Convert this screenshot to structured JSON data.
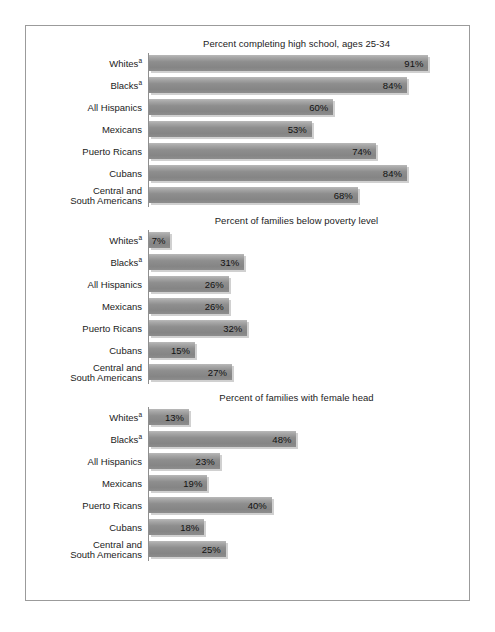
{
  "chart_data": [
    {
      "type": "bar",
      "orientation": "horizontal",
      "title": "Percent completing high school, ages 25-34",
      "xlabel": "",
      "ylabel": "",
      "xlim": [
        0,
        100
      ],
      "grid": false,
      "legend": "none",
      "categories": [
        "Whitesᵃ",
        "Blacksᵃ",
        "All Hispanics",
        "Mexicans",
        "Puerto Ricans",
        "Cubans",
        "Central and\nSouth Americans"
      ],
      "values": [
        91,
        84,
        60,
        53,
        74,
        84,
        68
      ],
      "value_labels": [
        "91%",
        "84%",
        "60%",
        "53%",
        "74%",
        "84%",
        "68%"
      ]
    },
    {
      "type": "bar",
      "orientation": "horizontal",
      "title": "Percent of families below poverty level",
      "xlabel": "",
      "ylabel": "",
      "xlim": [
        0,
        100
      ],
      "grid": false,
      "legend": "none",
      "categories": [
        "Whitesᵃ",
        "Blacksᵃ",
        "All Hispanics",
        "Mexicans",
        "Puerto Ricans",
        "Cubans",
        "Central and\nSouth Americans"
      ],
      "values": [
        7,
        31,
        26,
        26,
        32,
        15,
        27
      ],
      "value_labels": [
        "7%",
        "31%",
        "26%",
        "26%",
        "32%",
        "15%",
        "27%"
      ]
    },
    {
      "type": "bar",
      "orientation": "horizontal",
      "title": "Percent of families with female head",
      "xlabel": "",
      "ylabel": "",
      "xlim": [
        0,
        100
      ],
      "grid": false,
      "legend": "none",
      "categories": [
        "Whitesᵃ",
        "Blacksᵃ",
        "All Hispanics",
        "Mexicans",
        "Puerto Ricans",
        "Cubans",
        "Central and\nSouth Americans"
      ],
      "values": [
        13,
        48,
        23,
        19,
        40,
        18,
        25
      ],
      "value_labels": [
        "13%",
        "48%",
        "23%",
        "19%",
        "40%",
        "18%",
        "25%"
      ]
    }
  ],
  "panels": [
    {
      "title": "Percent completing high school, ages 25-34",
      "rows": [
        {
          "label": "Whites",
          "sup": "a",
          "value": 91,
          "value_label": "91%"
        },
        {
          "label": "Blacks",
          "sup": "a",
          "value": 84,
          "value_label": "84%"
        },
        {
          "label": "All Hispanics",
          "sup": "",
          "value": 60,
          "value_label": "60%"
        },
        {
          "label": "Mexicans",
          "sup": "",
          "value": 53,
          "value_label": "53%"
        },
        {
          "label": "Puerto Ricans",
          "sup": "",
          "value": 74,
          "value_label": "74%"
        },
        {
          "label": "Cubans",
          "sup": "",
          "value": 84,
          "value_label": "84%"
        },
        {
          "label": "Central and\nSouth Americans",
          "sup": "",
          "value": 68,
          "value_label": "68%"
        }
      ]
    },
    {
      "title": "Percent of families below poverty level",
      "rows": [
        {
          "label": "Whites",
          "sup": "a",
          "value": 7,
          "value_label": "7%"
        },
        {
          "label": "Blacks",
          "sup": "a",
          "value": 31,
          "value_label": "31%"
        },
        {
          "label": "All Hispanics",
          "sup": "",
          "value": 26,
          "value_label": "26%"
        },
        {
          "label": "Mexicans",
          "sup": "",
          "value": 26,
          "value_label": "26%"
        },
        {
          "label": "Puerto Ricans",
          "sup": "",
          "value": 32,
          "value_label": "32%"
        },
        {
          "label": "Cubans",
          "sup": "",
          "value": 15,
          "value_label": "15%"
        },
        {
          "label": "Central and\nSouth Americans",
          "sup": "",
          "value": 27,
          "value_label": "27%"
        }
      ]
    },
    {
      "title": "Percent of families with female head",
      "rows": [
        {
          "label": "Whites",
          "sup": "a",
          "value": 13,
          "value_label": "13%"
        },
        {
          "label": "Blacks",
          "sup": "a",
          "value": 48,
          "value_label": "48%"
        },
        {
          "label": "All Hispanics",
          "sup": "",
          "value": 23,
          "value_label": "23%"
        },
        {
          "label": "Mexicans",
          "sup": "",
          "value": 19,
          "value_label": "19%"
        },
        {
          "label": "Puerto Ricans",
          "sup": "",
          "value": 40,
          "value_label": "40%"
        },
        {
          "label": "Cubans",
          "sup": "",
          "value": 18,
          "value_label": "18%"
        },
        {
          "label": "Central and\nSouth Americans",
          "sup": "",
          "value": 25,
          "value_label": "25%"
        }
      ]
    }
  ],
  "style": {
    "bar_color": "#8e8e8e",
    "bar_highlight": "#b9b9b9",
    "shadow_color": "#aaaaaa",
    "axis_color": "#8f8f8f",
    "border_color": "#9b9b9b",
    "text_color": "#1b1b1b",
    "background": "#ffffff"
  },
  "scale": {
    "px_per_percent": 3.07,
    "max_percent": 100
  }
}
